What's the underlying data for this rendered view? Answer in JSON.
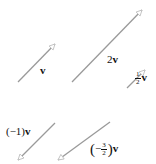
{
  "diagram": {
    "title": "",
    "stroke_color": "#9a9a9a",
    "arrowhead_color": "#bdbdbd",
    "label_color": "#111111",
    "vectors": [
      {
        "id": "v",
        "label": "v",
        "scalar": "1",
        "x1": 18,
        "y1": 82,
        "x2": 55,
        "y2": 44
      },
      {
        "id": "2v",
        "label": "2v",
        "scalar": "2",
        "x1": 72,
        "y1": 82,
        "x2": 142,
        "y2": 10
      },
      {
        "id": "half-v",
        "label": "½v",
        "scalar": "1/2",
        "x1": 127,
        "y1": 88,
        "x2": 145,
        "y2": 70
      },
      {
        "id": "neg-v",
        "label": "(−1)v",
        "scalar": "-1",
        "x1": 55,
        "y1": 123,
        "x2": 18,
        "y2": 160
      },
      {
        "id": "neg-three-halves-v",
        "label": "(−3/2)v",
        "scalar": "-3/2",
        "x1": 110,
        "y1": 122,
        "x2": 58,
        "y2": 160
      }
    ],
    "labels": {
      "v": {
        "text": "v"
      },
      "two_v": {
        "coef": "2",
        "vec": "v"
      },
      "half_v": {
        "num": "1",
        "den": "2",
        "vec": "v"
      },
      "neg_v": {
        "coef": "(−1)",
        "vec": "v"
      },
      "neg_three_halves_v": {
        "open": "(",
        "sign": "−",
        "num": "3",
        "den": "2",
        "close": ")",
        "vec": "v"
      }
    }
  }
}
